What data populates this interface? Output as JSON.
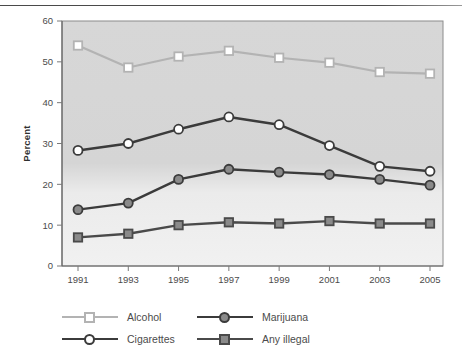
{
  "figure": {
    "top_rule": "horizontal-rule"
  },
  "chart_data": {
    "type": "line",
    "title": "",
    "xlabel": "Year",
    "ylabel": "Percent",
    "categories": [
      "1991",
      "1993",
      "1995",
      "1997",
      "1999",
      "2001",
      "2003",
      "2005"
    ],
    "x": [
      1991,
      1993,
      1995,
      1997,
      1999,
      2001,
      2003,
      2005
    ],
    "xlim": [
      1990,
      2006
    ],
    "ylim": [
      0,
      60
    ],
    "ytick_labels": [
      "0",
      "10",
      "20",
      "30",
      "40",
      "50",
      "60"
    ],
    "yticks": [
      0,
      10,
      20,
      30,
      40,
      50,
      60
    ],
    "grid": false,
    "legend_position": "below-axes",
    "plot_background": "#d9d9d9",
    "series": [
      {
        "name": "Alcohol",
        "values": [
          54.0,
          48.6,
          51.3,
          52.7,
          51.0,
          49.8,
          47.5,
          47.1
        ],
        "color": "#b3b3b3",
        "marker": "open-square",
        "marker_fill": "#ffffff"
      },
      {
        "name": "Cigarettes",
        "values": [
          28.3,
          30.0,
          33.5,
          36.5,
          34.6,
          29.5,
          24.4,
          23.2
        ],
        "color": "#3b3b3b",
        "marker": "open-circle",
        "marker_fill": "#ffffff"
      },
      {
        "name": "Marijuana",
        "values": [
          13.8,
          15.4,
          21.2,
          23.7,
          23.0,
          22.4,
          21.2,
          19.8
        ],
        "color": "#3b3b3b",
        "marker": "filled-circle",
        "marker_fill": "#8a8a8a"
      },
      {
        "name": "Any illegal",
        "values": [
          7.0,
          7.9,
          10.0,
          10.7,
          10.4,
          11.0,
          10.4,
          10.4
        ],
        "color": "#4a4a4a",
        "marker": "filled-square",
        "marker_fill": "#8a8a8a"
      }
    ]
  },
  "legend": {
    "entries": [
      {
        "label": "Alcohol",
        "series": 0
      },
      {
        "label": "Marijuana",
        "series": 2
      },
      {
        "label": "Cigarettes",
        "series": 1
      },
      {
        "label": "Any illegal",
        "series": 3
      }
    ]
  }
}
